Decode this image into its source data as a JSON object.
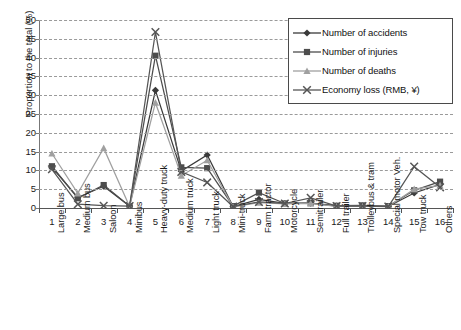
{
  "chart_data": {
    "type": "line",
    "title": "",
    "xlabel": "",
    "ylabel": "Proportion to the total (%)",
    "ylim": [
      0,
      50
    ],
    "ytick_step": 5,
    "grid": true,
    "legend_position": "top-right",
    "x": [
      1,
      2,
      3,
      4,
      5,
      6,
      7,
      8,
      9,
      10,
      11,
      12,
      13,
      14,
      15,
      16
    ],
    "categories": [
      "Large bus",
      "Medium bus",
      "Saloon",
      "Minibus",
      "Heavy-duty truck",
      "Medium truck",
      "Light truck",
      "Mini-truck",
      "Farm tractor",
      "Motorcycle",
      "Semitrailer",
      "Full trailer",
      "Trolleybus & tram",
      "Special motor Veh.",
      "Tow truck",
      "Others"
    ],
    "yticks": [
      0,
      5,
      10,
      15,
      20,
      25,
      30,
      35,
      40,
      45,
      50
    ],
    "series": [
      {
        "name": "Number of accidents",
        "marker": "diamond",
        "color": "#3a3a3a",
        "values": [
          10.8,
          2.8,
          5.8,
          0.5,
          31.3,
          9.8,
          14.1,
          0.4,
          2.3,
          1.2,
          1.3,
          0.5,
          0.5,
          0.4,
          4.0,
          6.3
        ]
      },
      {
        "name": "Number of injuries",
        "marker": "square",
        "color": "#4d4d4d",
        "values": [
          11.1,
          2.6,
          6.1,
          0.5,
          40.5,
          10.8,
          10.6,
          0.5,
          4.1,
          1.2,
          1.3,
          0.6,
          0.7,
          0.5,
          4.7,
          7.0
        ]
      },
      {
        "name": "Number of deaths",
        "marker": "triangle",
        "color": "#a0a0a0",
        "values": [
          14.5,
          3.9,
          15.9,
          0.4,
          28.0,
          8.6,
          12.7,
          0.3,
          1.4,
          1.1,
          1.2,
          0.4,
          0.4,
          0.4,
          5.0,
          6.0
        ]
      },
      {
        "name": "Economy loss (RMB, ¥)",
        "marker": "cross",
        "color": "#555555",
        "values": [
          10.3,
          1.0,
          0.6,
          0.5,
          46.8,
          9.6,
          6.8,
          0.4,
          1.6,
          1.2,
          2.7,
          0.5,
          0.5,
          0.4,
          11.0,
          5.5
        ]
      }
    ]
  },
  "legend": {
    "items": [
      {
        "label": "Number of accidents"
      },
      {
        "label": "Number of injuries"
      },
      {
        "label": "Number of deaths"
      },
      {
        "label": "Economy loss (RMB, ¥)"
      }
    ]
  }
}
